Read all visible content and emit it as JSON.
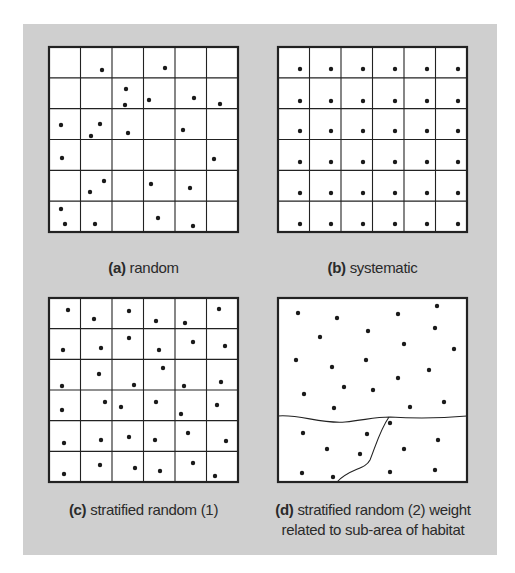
{
  "figure": {
    "background_color": "#cfcfcf",
    "panel_fill": "#ffffff",
    "line_color": "#222222",
    "dot_color": "#1a1a1a"
  },
  "panels": [
    {
      "id": "a",
      "letter": "(a)",
      "label": "random",
      "caption_line2": "",
      "box": {
        "x": 49,
        "y": 47,
        "w": 189,
        "h": 185
      },
      "grid": {
        "cols": 6,
        "rows": 6
      },
      "dots": [
        [
          102,
          70
        ],
        [
          165,
          68
        ],
        [
          126,
          89
        ],
        [
          125,
          105
        ],
        [
          149,
          100
        ],
        [
          194,
          98
        ],
        [
          220,
          104
        ],
        [
          61,
          125
        ],
        [
          100,
          124
        ],
        [
          91,
          136
        ],
        [
          128,
          133
        ],
        [
          183,
          130
        ],
        [
          62,
          158
        ],
        [
          214,
          159
        ],
        [
          104,
          181
        ],
        [
          90,
          192
        ],
        [
          151,
          184
        ],
        [
          190,
          188
        ],
        [
          61,
          209
        ],
        [
          65,
          224
        ],
        [
          95,
          224
        ],
        [
          158,
          218
        ],
        [
          193,
          226
        ]
      ]
    },
    {
      "id": "b",
      "letter": "(b)",
      "label": "systematic",
      "caption_line2": "",
      "box": {
        "x": 278,
        "y": 47,
        "w": 189,
        "h": 185
      },
      "grid": {
        "cols": 6,
        "rows": 6
      },
      "dots_systematic": {
        "xs": [
          300,
          331,
          363,
          395,
          427,
          458
        ],
        "ys": [
          69,
          101,
          131,
          162,
          193,
          224
        ]
      }
    },
    {
      "id": "c",
      "letter": "(c)",
      "label": "stratified random (1)",
      "caption_line2": "",
      "box": {
        "x": 49,
        "y": 298,
        "w": 189,
        "h": 184
      },
      "grid": {
        "cols": 6,
        "rows": 6
      },
      "dots": [
        [
          68,
          310
        ],
        [
          94,
          319
        ],
        [
          129,
          311
        ],
        [
          156,
          321
        ],
        [
          185,
          323
        ],
        [
          219,
          309
        ],
        [
          63,
          350
        ],
        [
          101,
          348
        ],
        [
          129,
          338
        ],
        [
          159,
          350
        ],
        [
          193,
          342
        ],
        [
          225,
          346
        ],
        [
          62,
          386
        ],
        [
          99,
          374
        ],
        [
          134,
          385
        ],
        [
          163,
          368
        ],
        [
          184,
          386
        ],
        [
          221,
          382
        ],
        [
          62,
          410
        ],
        [
          105,
          402
        ],
        [
          121,
          407
        ],
        [
          156,
          402
        ],
        [
          181,
          414
        ],
        [
          217,
          405
        ],
        [
          64,
          443
        ],
        [
          101,
          440
        ],
        [
          129,
          437
        ],
        [
          155,
          440
        ],
        [
          188,
          433
        ],
        [
          226,
          441
        ],
        [
          64,
          474
        ],
        [
          100,
          465
        ],
        [
          135,
          468
        ],
        [
          160,
          471
        ],
        [
          193,
          463
        ],
        [
          215,
          476
        ]
      ]
    },
    {
      "id": "d",
      "letter": "(d)",
      "label": "stratified random (2) weight",
      "caption_line2": "related to sub-area of habitat",
      "box": {
        "x": 278,
        "y": 298,
        "w": 189,
        "h": 184
      },
      "boundaries": [
        "M278,416 C300,414 320,424 345,422 C365,420 375,417 390,417 C420,419 445,418 467,416",
        "M389,417 C380,430 376,445 370,460 C365,470 350,468 337,482"
      ],
      "dots": [
        [
          298,
          313
        ],
        [
          337,
          318
        ],
        [
          398,
          314
        ],
        [
          437,
          306
        ],
        [
          320,
          337
        ],
        [
          368,
          331
        ],
        [
          435,
          328
        ],
        [
          404,
          344
        ],
        [
          454,
          349
        ],
        [
          296,
          360
        ],
        [
          332,
          367
        ],
        [
          366,
          360
        ],
        [
          429,
          370
        ],
        [
          398,
          378
        ],
        [
          344,
          387
        ],
        [
          373,
          390
        ],
        [
          304,
          394
        ],
        [
          334,
          408
        ],
        [
          410,
          407
        ],
        [
          444,
          402
        ],
        [
          390,
          423
        ],
        [
          303,
          433
        ],
        [
          367,
          434
        ],
        [
          438,
          440
        ],
        [
          327,
          449
        ],
        [
          360,
          454
        ],
        [
          404,
          449
        ],
        [
          302,
          473
        ],
        [
          333,
          477
        ],
        [
          390,
          472
        ],
        [
          435,
          470
        ]
      ]
    }
  ],
  "captions": {
    "a": {
      "letter": "(a)",
      "text": " random"
    },
    "b": {
      "letter": "(b)",
      "text": " systematic"
    },
    "c": {
      "letter": "(c)",
      "text": " stratified random (1)"
    },
    "d": {
      "letter": "(d)",
      "text": " stratified random (2) weight",
      "line2": "related to sub-area of habitat"
    }
  }
}
